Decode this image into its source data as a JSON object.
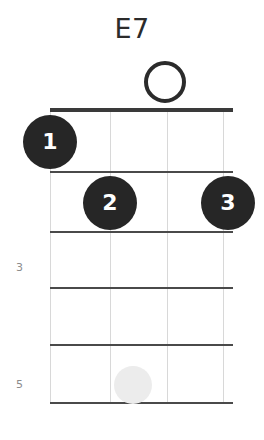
{
  "chart_data": {
    "type": "diagram",
    "diagram_kind": "chord-diagram",
    "instrument": "ukulele",
    "title": "E7",
    "string_count": 4,
    "fret_count": 5,
    "starting_fret": 1,
    "nut_shown": true,
    "fret_labels": [
      {
        "label": "3",
        "fret": 3,
        "x": 15,
        "y": 262
      },
      {
        "label": "5",
        "fret": 5,
        "x": 15,
        "y": 379
      }
    ],
    "strings_x": [
      50,
      110,
      167,
      223
    ],
    "fret_lines_y": [
      110,
      172,
      232,
      288,
      345,
      403
    ],
    "grid": {
      "left": 50,
      "right": 233,
      "top": 110,
      "bottom": 403,
      "width": 183,
      "height": 293
    },
    "open_strings": [
      {
        "string": 3,
        "x": 165,
        "y": 82,
        "size": 42,
        "label": "o"
      }
    ],
    "muted_strings": [],
    "fingerings": [
      {
        "finger": "1",
        "string": 1,
        "fret": 1,
        "x": 50,
        "y": 142,
        "size": 54
      },
      {
        "finger": "2",
        "string": 2,
        "fret": 2,
        "x": 110,
        "y": 203,
        "size": 54
      },
      {
        "finger": "3",
        "string": 4,
        "fret": 2,
        "x": 228,
        "y": 203,
        "size": 54
      }
    ],
    "ghost_markers": [
      {
        "string": 2,
        "fret": 5,
        "x": 133,
        "y": 385,
        "size": 38
      }
    ],
    "colors": {
      "dot_fill": "#262626",
      "dot_text": "#ffffff",
      "nut": "#3a3a3a",
      "fret": "#4a4a4a",
      "string": "#d8d8d8",
      "title": "#2b2b2b",
      "fret_number": "#8c8c8c",
      "ghost": "#ececec",
      "background": "#ffffff"
    }
  }
}
